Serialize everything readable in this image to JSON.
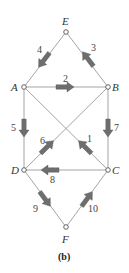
{
  "caption": "(b)",
  "colors": {
    "edge": "#9a9a9a",
    "arrow": "#6e6e6e",
    "node_fill": "#ffffff",
    "node_stroke": "#555555",
    "text": "#444444"
  },
  "nodes": [
    {
      "id": "E",
      "label": "E",
      "x": 66,
      "y": 32
    },
    {
      "id": "A",
      "label": "A",
      "x": 24,
      "y": 87
    },
    {
      "id": "B",
      "label": "B",
      "x": 108,
      "y": 87
    },
    {
      "id": "D",
      "label": "D",
      "x": 24,
      "y": 170
    },
    {
      "id": "C",
      "label": "C",
      "x": 108,
      "y": 170
    },
    {
      "id": "F",
      "label": "F",
      "x": 66,
      "y": 227
    }
  ],
  "edges": [
    {
      "from": "E",
      "to": "A"
    },
    {
      "from": "E",
      "to": "B"
    },
    {
      "from": "A",
      "to": "B"
    },
    {
      "from": "A",
      "to": "D"
    },
    {
      "from": "B",
      "to": "C"
    },
    {
      "from": "A",
      "to": "C"
    },
    {
      "from": "B",
      "to": "D"
    },
    {
      "from": "D",
      "to": "C"
    },
    {
      "from": "D",
      "to": "F"
    },
    {
      "from": "C",
      "to": "F"
    }
  ],
  "arrows": [
    {
      "label": "1",
      "edge": "C-A",
      "direction": "toward A (up-left)"
    },
    {
      "label": "2",
      "edge": "A-B",
      "direction": "toward B (right)"
    },
    {
      "label": "3",
      "edge": "B-E",
      "direction": "toward E (up-left)"
    },
    {
      "label": "4",
      "edge": "E-A",
      "direction": "toward A (down-left)"
    },
    {
      "label": "5",
      "edge": "A-D",
      "direction": "toward D (down)"
    },
    {
      "label": "6",
      "edge": "D-B",
      "direction": "toward B (up-right)"
    },
    {
      "label": "7",
      "edge": "B-C",
      "direction": "toward C (down)"
    },
    {
      "label": "8",
      "edge": "C-D",
      "direction": "toward D (left)"
    },
    {
      "label": "9",
      "edge": "D-F",
      "direction": "toward F (down-right)"
    },
    {
      "label": "10",
      "edge": "F-C",
      "direction": "toward C (up-right)"
    }
  ]
}
